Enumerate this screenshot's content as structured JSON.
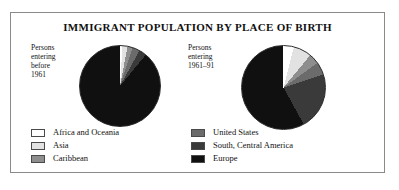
{
  "figure": {
    "title": "IMMIGRANT POPULATION BY PLACE OF BIRTH"
  },
  "captions": {
    "left": [
      "Persons",
      "entering",
      "before",
      "1961"
    ],
    "right": [
      "Persons",
      "entering",
      "1961–91"
    ]
  },
  "legend": {
    "left_items": [
      {
        "label": "Africa and Oceania",
        "color": "#ffffff"
      },
      {
        "label": "Asia",
        "color": "#e2e2e2"
      },
      {
        "label": "Caribbean",
        "color": "#8e8e8e"
      }
    ],
    "right_items": [
      {
        "label": "United States",
        "color": "#6b6b6b"
      },
      {
        "label": "South, Central America",
        "color": "#3a3a3a"
      },
      {
        "label": "Europe",
        "color": "#101010"
      }
    ]
  },
  "chart_data": {
    "type": "pie",
    "title": "IMMIGRANT POPULATION BY PLACE OF BIRTH",
    "legend_position": "bottom",
    "categories": [
      "Africa and Oceania",
      "Asia",
      "Caribbean",
      "United States",
      "South, Central America",
      "Europe"
    ],
    "colors": [
      "#ffffff",
      "#e2e2e2",
      "#8e8e8e",
      "#6b6b6b",
      "#3a3a3a",
      "#101010"
    ],
    "charts": [
      {
        "name": "Persons entering before 1961",
        "values": [
          1,
          2,
          2,
          3,
          3,
          89
        ],
        "unit": "percent"
      },
      {
        "name": "Persons entering 1961–91",
        "values": [
          4,
          7,
          4,
          5,
          22,
          58
        ],
        "unit": "percent"
      }
    ]
  }
}
